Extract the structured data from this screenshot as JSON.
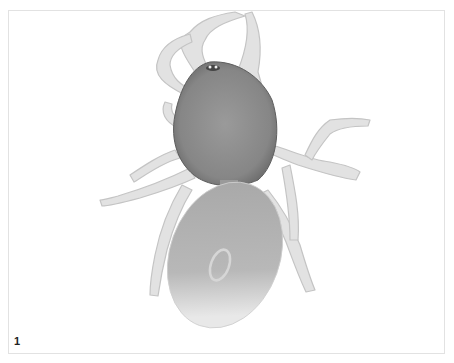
{
  "figure": {
    "label": "1",
    "colors": {
      "background": "#ffffff",
      "frame": "#e2e2e2",
      "carapace": "#8c8c8c",
      "abdomen": "#b4b4b4",
      "legs": "#dcdcdc",
      "label": "#222222"
    }
  }
}
